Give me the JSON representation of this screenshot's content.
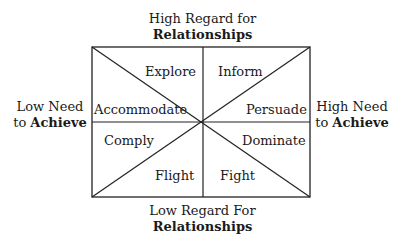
{
  "axes": {
    "top": {
      "line1": "High Regard for",
      "line2": "Relationships"
    },
    "bottom": {
      "line1": "Low Regard For",
      "line2": "Relationships"
    },
    "left": {
      "line1": "Low Need",
      "line2_prefix": "to ",
      "line2_bold": "Achieve"
    },
    "right": {
      "line1": "High Need",
      "line2_prefix": "to ",
      "line2_bold": "Achieve"
    }
  },
  "segments": [
    {
      "id": "explore",
      "label": "Explore"
    },
    {
      "id": "inform",
      "label": "Inform"
    },
    {
      "id": "accommodate",
      "label": "Accommodate"
    },
    {
      "id": "persuade",
      "label": "Persuade"
    },
    {
      "id": "comply",
      "label": "Comply"
    },
    {
      "id": "dominate",
      "label": "Dominate"
    },
    {
      "id": "flight",
      "label": "Flight"
    },
    {
      "id": "fight",
      "label": "Fight"
    }
  ],
  "colors": {
    "line": "#222222",
    "text": "#1a1a1a",
    "background": "#ffffff"
  }
}
